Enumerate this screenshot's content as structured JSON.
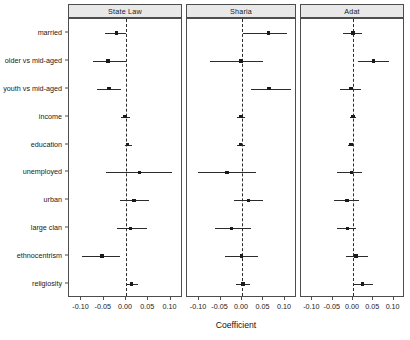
{
  "chart_data": {
    "type": "scatter",
    "plot_style": "coefficient-forest-plot",
    "title": "",
    "xlabel": "Coefficient",
    "ylabel": "",
    "xlim": [
      -0.128,
      0.128
    ],
    "xticks": [
      -0.1,
      -0.05,
      0.0,
      0.05,
      0.1
    ],
    "xticklabels": [
      "-0.10",
      "-0.05",
      "0.00",
      "0.05",
      "0.10"
    ],
    "grid": false,
    "reference_line": 0.0,
    "reference_line_style": "dashed",
    "legend": null,
    "categories": [
      "married",
      "older vs mid-aged",
      "youth vs mid-aged",
      "income",
      "education",
      "unemployed",
      "urban",
      "large clan",
      "ethnocentrism",
      "religiosity"
    ],
    "panels": [
      {
        "label": "State Law",
        "series": [
          {
            "name": "married",
            "estimate": -0.021,
            "ci_low": -0.047,
            "ci_high": 0.001
          },
          {
            "name": "older vs mid-aged",
            "estimate": -0.04,
            "ci_low": -0.075,
            "ci_high": 0.0
          },
          {
            "name": "youth vs mid-aged",
            "estimate": -0.038,
            "ci_low": -0.066,
            "ci_high": -0.012
          },
          {
            "name": "income",
            "estimate": -0.002,
            "ci_low": -0.011,
            "ci_high": 0.01
          },
          {
            "name": "education",
            "estimate": 0.004,
            "ci_low": -0.003,
            "ci_high": 0.013
          },
          {
            "name": "unemployed",
            "estimate": 0.03,
            "ci_low": -0.046,
            "ci_high": 0.103
          },
          {
            "name": "urban",
            "estimate": 0.018,
            "ci_low": -0.014,
            "ci_high": 0.051
          },
          {
            "name": "large clan",
            "estimate": 0.01,
            "ci_low": -0.021,
            "ci_high": 0.047
          },
          {
            "name": "ethnocentrism",
            "estimate": -0.054,
            "ci_low": -0.098,
            "ci_high": -0.013
          },
          {
            "name": "religiosity",
            "estimate": 0.012,
            "ci_low": -0.001,
            "ci_high": 0.026
          }
        ]
      },
      {
        "label": "Sharia",
        "series": [
          {
            "name": "married",
            "estimate": 0.062,
            "ci_low": 0.003,
            "ci_high": 0.104
          },
          {
            "name": "older vs mid-aged",
            "estimate": -0.002,
            "ci_low": -0.075,
            "ci_high": 0.05
          },
          {
            "name": "youth vs mid-aged",
            "estimate": 0.063,
            "ci_low": 0.02,
            "ci_high": 0.113
          },
          {
            "name": "income",
            "estimate": -0.002,
            "ci_low": -0.011,
            "ci_high": 0.008
          },
          {
            "name": "education",
            "estimate": -0.003,
            "ci_low": -0.012,
            "ci_high": 0.007
          },
          {
            "name": "unemployed",
            "estimate": -0.035,
            "ci_low": -0.103,
            "ci_high": 0.032
          },
          {
            "name": "urban",
            "estimate": 0.015,
            "ci_low": -0.019,
            "ci_high": 0.049
          },
          {
            "name": "large clan",
            "estimate": -0.024,
            "ci_low": -0.064,
            "ci_high": 0.021
          },
          {
            "name": "ethnocentrism",
            "estimate": -0.001,
            "ci_low": -0.039,
            "ci_high": 0.038
          },
          {
            "name": "religiosity",
            "estimate": 0.002,
            "ci_low": -0.014,
            "ci_high": 0.018
          }
        ]
      },
      {
        "label": "Adat",
        "series": [
          {
            "name": "married",
            "estimate": 0.0,
            "ci_low": -0.024,
            "ci_high": 0.022
          },
          {
            "name": "older vs mid-aged",
            "estimate": 0.05,
            "ci_low": 0.012,
            "ci_high": 0.088
          },
          {
            "name": "youth vs mid-aged",
            "estimate": -0.005,
            "ci_low": -0.032,
            "ci_high": 0.019
          },
          {
            "name": "income",
            "estimate": 0.0,
            "ci_low": -0.007,
            "ci_high": 0.007
          },
          {
            "name": "education",
            "estimate": -0.005,
            "ci_low": -0.012,
            "ci_high": 0.001
          },
          {
            "name": "unemployed",
            "estimate": -0.004,
            "ci_low": -0.04,
            "ci_high": 0.022
          },
          {
            "name": "urban",
            "estimate": -0.015,
            "ci_low": -0.046,
            "ci_high": 0.015
          },
          {
            "name": "large clan",
            "estimate": -0.014,
            "ci_low": -0.039,
            "ci_high": 0.008
          },
          {
            "name": "ethnocentrism",
            "estimate": 0.007,
            "ci_low": -0.018,
            "ci_high": 0.036
          },
          {
            "name": "religiosity",
            "estimate": 0.024,
            "ci_low": 0.001,
            "ci_high": 0.049
          }
        ]
      }
    ],
    "colors": {
      "point": "#1a1a1a",
      "interval": "#2b2b2b",
      "reference": "#2b2b2b",
      "strip_background": "#e8e8e8",
      "panel_border": "#4d4d4d",
      "background": "#ffffff"
    }
  }
}
